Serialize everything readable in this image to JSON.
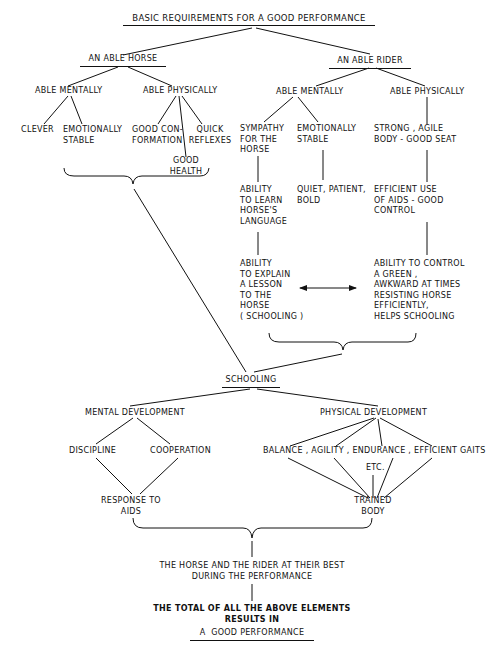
{
  "title": "BASIC REQUIREMENTS FOR A GOOD PERFORMANCE",
  "horse": {
    "heading": "AN ABLE HORSE",
    "mentally": {
      "label": "ABLE MENTALLY",
      "items": [
        "CLEVER",
        "EMOTIONALLY\nSTABLE"
      ]
    },
    "physically": {
      "label": "ABLE PHYSICALLY",
      "items": [
        "GOOD CON-\nFORMATION",
        "QUICK\nREFLEXES",
        "GOOD\nHEALTH"
      ]
    }
  },
  "rider": {
    "heading": "AN ABLE RIDER",
    "mentally": {
      "label": "ABLE MENTALLY",
      "sympathy": "SYMPATHY\nFOR THE\nHORSE",
      "learn": "ABILITY\nTO LEARN\nHORSE'S\nLANGUAGE",
      "explain": "ABILITY\nTO EXPLAIN\nA LESSON\nTO THE\nHORSE\n( SCHOOLING )",
      "stable": "EMOTIONALLY\nSTABLE",
      "quiet": "QUIET, PATIENT,\nBOLD"
    },
    "physically": {
      "label": "ABLE PHYSICALLY",
      "strong": "STRONG , AGILE\nBODY - GOOD SEAT",
      "aids": "EFFICIENT USE\nOF AIDS - GOOD\nCONTROL",
      "control": "ABILITY TO CONTROL\nA GREEN ,\nAWKWARD AT TIMES\nRESISTING HORSE\nEFFICIENTLY,\nHELPS SCHOOLING"
    }
  },
  "schooling": {
    "label": "SCHOOLING",
    "mental": {
      "label": "MENTAL DEVELOPMENT",
      "items": [
        "DISCIPLINE",
        "COOPERATION"
      ],
      "result": "RESPONSE TO\nAIDS"
    },
    "physical": {
      "label": "PHYSICAL DEVELOPMENT",
      "items": [
        "BALANCE",
        "AGILITY",
        "ENDURANCE",
        "EFFICIENT GAITS",
        "ETC."
      ],
      "items_line": "BALANCE , AGILITY , ENDURANCE , EFFICIENT GAITS",
      "result": "TRAINED\nBODY"
    }
  },
  "outcome": {
    "best": "THE HORSE AND THE RIDER AT THEIR BEST\nDURING THE PERFORMANCE",
    "total": "THE TOTAL OF ALL THE ABOVE ELEMENTS\nRESULTS IN",
    "final": "A  GOOD PERFORMANCE"
  }
}
